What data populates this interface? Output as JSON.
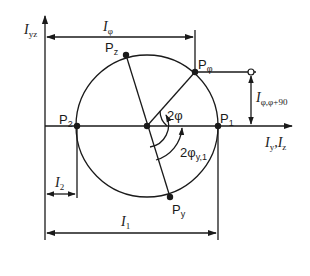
{
  "diagram": {
    "axes": {
      "vertical_label_main": "I",
      "vertical_label_sub": "yz",
      "horizontal_label": "I",
      "horizontal_label_sub1": "y",
      "horizontal_label_sep": ",I",
      "horizontal_label_sub2": "z"
    },
    "points": [
      {
        "id": "P1",
        "main": "P",
        "sub": "1"
      },
      {
        "id": "P2",
        "main": "P",
        "sub": "2"
      },
      {
        "id": "Pz",
        "main": "P",
        "sub": "z"
      },
      {
        "id": "Py",
        "main": "P",
        "sub": "y"
      },
      {
        "id": "Pphi",
        "main": "P",
        "sub": "φ"
      }
    ],
    "dimensions": {
      "I_phi": {
        "main": "I",
        "sub": "φ"
      },
      "I_1": {
        "main": "I",
        "sub": "1"
      },
      "I_2": {
        "main": "I",
        "sub": "2"
      },
      "I_phi_phi90": {
        "main": "I",
        "sub": "φ,φ+90"
      }
    },
    "angles": {
      "two_phi": "2φ",
      "two_phi_y1_main": "2φ",
      "two_phi_y1_sub": "y,1"
    },
    "colors": {
      "line": "#1a1a1a",
      "background": "#ffffff"
    }
  }
}
